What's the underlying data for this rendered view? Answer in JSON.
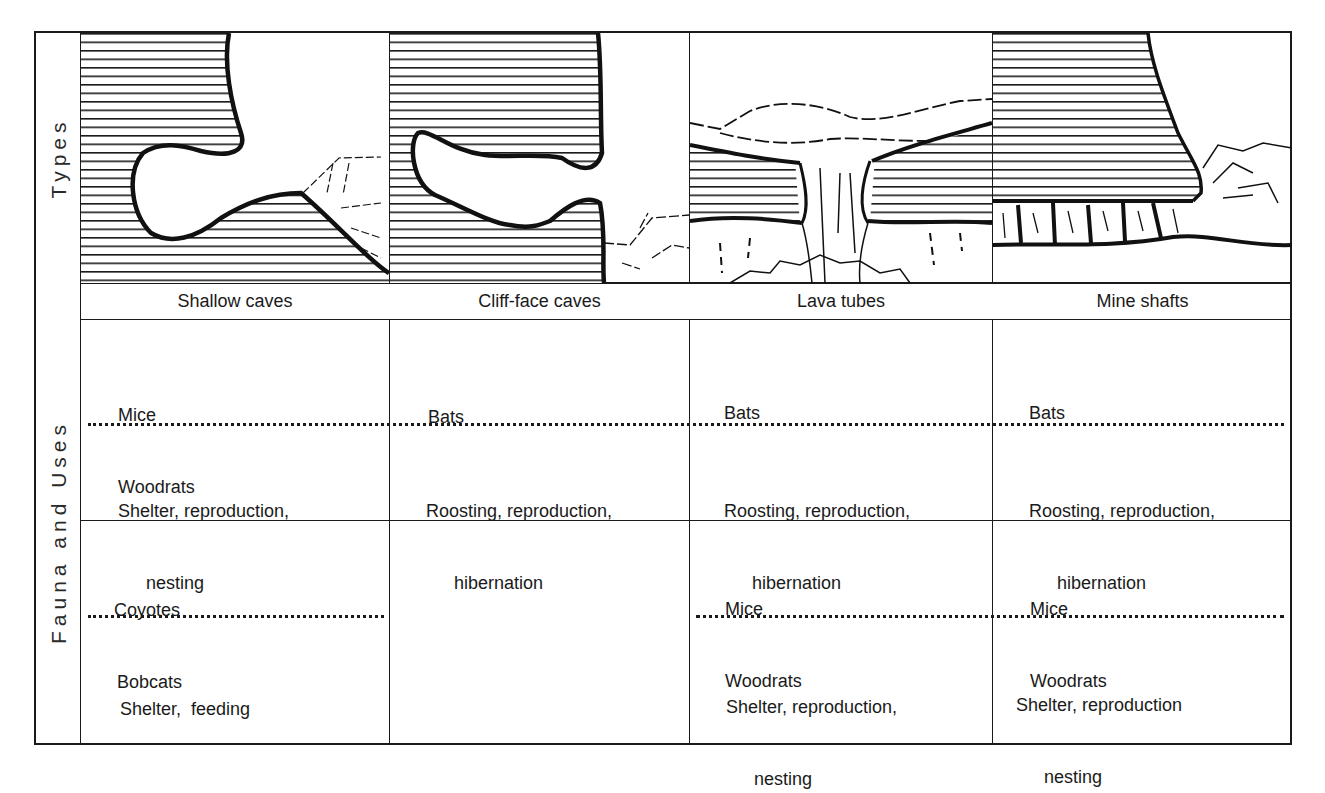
{
  "row_labels": {
    "types": "Types",
    "fauna_and_uses": "Fauna and Uses"
  },
  "columns": [
    {
      "name": "Shallow caves",
      "illustration": "shallow-cave-cross-section",
      "group1": {
        "fauna": [
          "Mice",
          "Woodrats"
        ],
        "uses_line1": "Shelter, reproduction,",
        "uses_line2": "nesting"
      },
      "group2": {
        "fauna": [
          "Coyotes",
          "Bobcats"
        ],
        "uses_line1": "Shelter,  feeding",
        "uses_line2": ""
      }
    },
    {
      "name": "Cliff-face caves",
      "illustration": "cliff-face-cave-cross-section",
      "group1": {
        "fauna": [
          "Bats",
          ""
        ],
        "uses_line1": "Roosting, reproduction,",
        "uses_line2": "hibernation"
      },
      "group2": {
        "fauna": [
          "",
          ""
        ],
        "uses_line1": "",
        "uses_line2": ""
      }
    },
    {
      "name": "Lava tubes",
      "illustration": "lava-tube-cross-section",
      "group1": {
        "fauna": [
          "Bats",
          ""
        ],
        "uses_line1": "Roosting, reproduction,",
        "uses_line2": "hibernation"
      },
      "group2": {
        "fauna": [
          "Mice",
          "Woodrats"
        ],
        "uses_line1": "Shelter, reproduction,",
        "uses_line2": "nesting"
      }
    },
    {
      "name": "Mine shafts",
      "illustration": "mine-shaft-cross-section",
      "group1": {
        "fauna": [
          "Bats",
          ""
        ],
        "uses_line1": "Roosting, reproduction,",
        "uses_line2": "hibernation"
      },
      "group2": {
        "fauna": [
          "Mice",
          "Woodrats"
        ],
        "uses_line1": "Shelter, reproduction",
        "uses_line2": "nesting"
      }
    }
  ],
  "colors": {
    "ink": "#1a1a1a",
    "background": "#ffffff"
  }
}
